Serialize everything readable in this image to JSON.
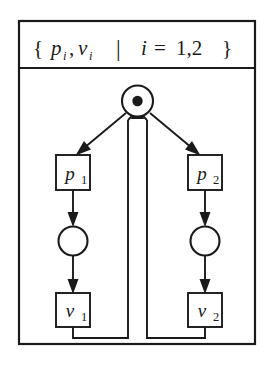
{
  "figure": {
    "type": "petri-net-diagram",
    "header": {
      "full_text": "{ p_i, v_i  |  i = 1,2 }",
      "open_brace": "{",
      "symbol_p": "p",
      "symbol_p_sub": "i",
      "comma": ",",
      "symbol_v": "v",
      "symbol_v_sub": "i",
      "separator": "|",
      "index_var": "i",
      "equals": "=",
      "index_values": "1,2",
      "close_brace": "}"
    },
    "nodes": {
      "root_place": {
        "label": "",
        "shape": "circle",
        "tokens": 1,
        "token_glyph": "filled-dot"
      },
      "transition_p1": {
        "label": "p",
        "subscript": "1",
        "shape": "square"
      },
      "transition_p2": {
        "label": "p",
        "subscript": "2",
        "shape": "square"
      },
      "place_left": {
        "label": "",
        "shape": "circle",
        "tokens": 0
      },
      "place_right": {
        "label": "",
        "shape": "circle",
        "tokens": 0
      },
      "transition_v1": {
        "label": "v",
        "subscript": "1",
        "shape": "square"
      },
      "transition_v2": {
        "label": "v",
        "subscript": "2",
        "shape": "square"
      }
    },
    "colors": {
      "ink": "#1a1a1a",
      "paper": "#ffffff"
    }
  }
}
